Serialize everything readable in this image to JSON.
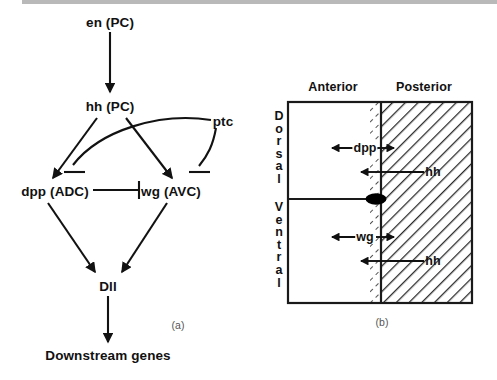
{
  "figure": {
    "panel_a": {
      "caption": "(a)",
      "nodes": [
        {
          "id": "en",
          "label": "en (PC)",
          "x": 110,
          "y": 22
        },
        {
          "id": "hh",
          "label": "hh (PC)",
          "x": 110,
          "y": 106
        },
        {
          "id": "ptc",
          "label": "ptc",
          "x": 223,
          "y": 121
        },
        {
          "id": "dpp",
          "label": "dpp (ADC)",
          "x": 55,
          "y": 191
        },
        {
          "id": "wg",
          "label": "wg (AVC)",
          "x": 171,
          "y": 191
        },
        {
          "id": "dll",
          "label": "Dll",
          "x": 108,
          "y": 286
        },
        {
          "id": "dsg",
          "label": "Downstream genes",
          "x": 108,
          "y": 355
        }
      ],
      "edges": [
        {
          "from": "en",
          "to": "hh",
          "type": "activation"
        },
        {
          "from": "hh",
          "to": "dpp",
          "type": "activation"
        },
        {
          "from": "hh",
          "to": "wg",
          "type": "activation"
        },
        {
          "from": "ptc",
          "to": "dpp",
          "type": "inhibition"
        },
        {
          "from": "ptc",
          "to": "wg",
          "type": "inhibition"
        },
        {
          "from": "dpp",
          "to": "wg",
          "type": "inhibition"
        },
        {
          "from": "dpp",
          "to": "dll",
          "type": "activation"
        },
        {
          "from": "wg",
          "to": "dll",
          "type": "activation"
        },
        {
          "from": "dll",
          "to": "dsg",
          "type": "activation"
        }
      ]
    },
    "panel_b": {
      "caption": "(b)",
      "compartments": {
        "anterior": "Anterior",
        "posterior": "Posterior"
      },
      "axis": {
        "dorsal": "Dorsal",
        "ventral": "Ventral"
      },
      "signals": [
        {
          "id": "dpp",
          "label": "dpp",
          "region": "dorsal",
          "direction": "bidirectional"
        },
        {
          "id": "hh-dorsal",
          "label": "hh",
          "region": "dorsal",
          "direction": "anterior"
        },
        {
          "id": "wg",
          "label": "wg",
          "region": "ventral",
          "direction": "bidirectional"
        },
        {
          "id": "hh-ventral",
          "label": "hh",
          "region": "ventral",
          "direction": "anterior"
        }
      ],
      "colors": {
        "line": "#1a1a1a",
        "hatch": "#2b2b2b",
        "stipple": "#4a4a4a",
        "marker": "#000000"
      }
    }
  }
}
